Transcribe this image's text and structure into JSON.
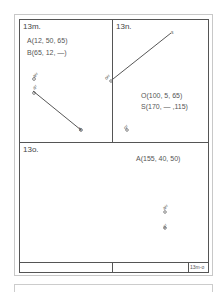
{
  "panels": {
    "m": {
      "title": "13m.",
      "points": [
        "A(12, 50, 65)",
        "B(65, 12, —)"
      ],
      "labels": {
        "aH": "aᴴ",
        "aF": "aᶠ",
        "b": "b"
      }
    },
    "n": {
      "title": "13n.",
      "points": [
        "O(100, 5, 65)",
        "S(170, — ,115)"
      ],
      "labels": {
        "oH": "oᴴ",
        "s": "s",
        "oF": "oᶠ"
      }
    },
    "o": {
      "title": "13o.",
      "points": [
        "A(155, 40, 50)"
      ],
      "labels": {
        "aH": "aᴴ",
        "aF": "aᶠ"
      }
    }
  },
  "title_block": {
    "sheet_id": "13m-o"
  },
  "colors": {
    "line": "#555555",
    "outer_frame": "#c8c8c8",
    "background": "#ffffff"
  }
}
